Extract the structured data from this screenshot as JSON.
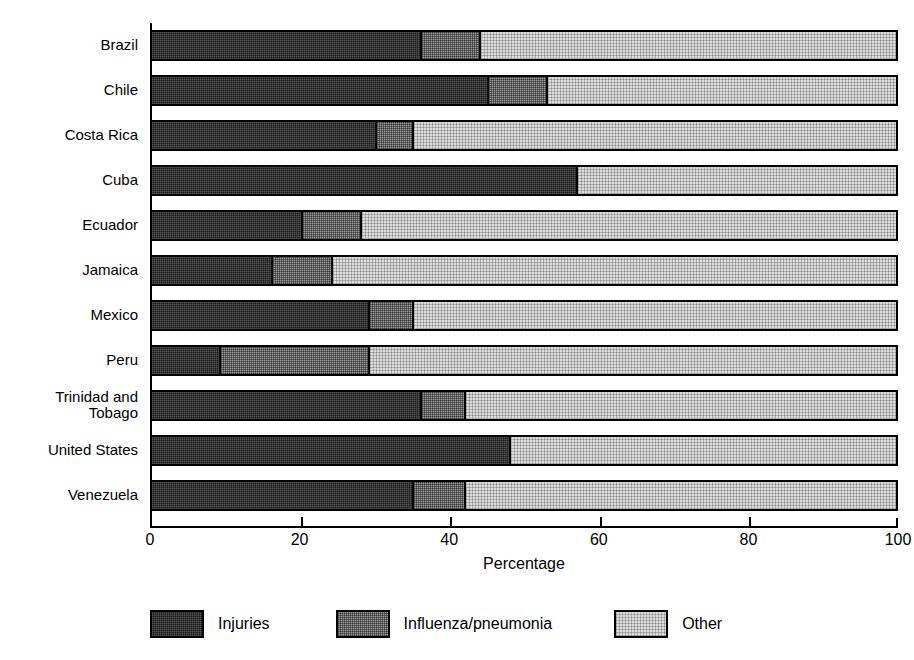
{
  "chart_data": {
    "type": "bar",
    "orientation": "horizontal",
    "stacked": true,
    "stack_total": 100,
    "title": "",
    "xlabel": "Percentage",
    "ylabel": "",
    "xlim": [
      0,
      100
    ],
    "xticks": [
      0,
      20,
      40,
      60,
      80,
      100
    ],
    "grid": false,
    "legend_position": "bottom",
    "categories": [
      "Brazil",
      "Chile",
      "Costa Rica",
      "Cuba",
      "Ecuador",
      "Jamaica",
      "Mexico",
      "Peru",
      "Trinidad and\nTobago",
      "United States",
      "Venezuela"
    ],
    "series": [
      {
        "name": "Injuries",
        "color": "#1a1a1a",
        "values": [
          36,
          45,
          30,
          57,
          20,
          16,
          29,
          9,
          36,
          48,
          35
        ]
      },
      {
        "name": "Influenza/pneumonia",
        "color": "#9a9a9a",
        "values": [
          8,
          8,
          5,
          0,
          8,
          8,
          6,
          20,
          6,
          0,
          7
        ]
      },
      {
        "name": "Other",
        "color": "#dcdcdc",
        "values": [
          56,
          47,
          65,
          43,
          72,
          76,
          65,
          71,
          58,
          52,
          58
        ]
      }
    ]
  },
  "legend": {
    "items": [
      {
        "label": "Injuries",
        "swatch": "injuries-swatch"
      },
      {
        "label": "Influenza/pneumonia",
        "swatch": "influenza-swatch"
      },
      {
        "label": "Other",
        "swatch": "other-swatch"
      }
    ]
  },
  "axis": {
    "x_title": "Percentage",
    "tick_labels": [
      "0",
      "20",
      "40",
      "60",
      "80",
      "100"
    ]
  }
}
